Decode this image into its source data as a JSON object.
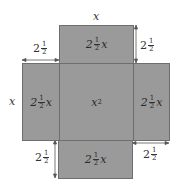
{
  "diagram": {
    "colors": {
      "face": "#9a9a9a",
      "edge": "#6e6e6e",
      "text": "#2a2a2a"
    },
    "faces": {
      "top": {
        "whole": "2",
        "num": "1",
        "den": "2",
        "var": "x"
      },
      "left": {
        "whole": "2",
        "num": "1",
        "den": "2",
        "var": "x"
      },
      "center": {
        "label": "x",
        "exp": "2"
      },
      "right": {
        "whole": "2",
        "num": "1",
        "den": "2",
        "var": "x"
      },
      "bottom": {
        "whole": "2",
        "num": "1",
        "den": "2",
        "var": "x"
      }
    },
    "dimensions": {
      "top_width": "x",
      "left_height": "x",
      "top_left": {
        "whole": "2",
        "num": "1",
        "den": "2"
      },
      "top_right": {
        "whole": "2",
        "num": "1",
        "den": "2"
      },
      "bottom_left": {
        "whole": "2",
        "num": "1",
        "den": "2"
      },
      "bottom_right": {
        "whole": "2",
        "num": "1",
        "den": "2"
      }
    }
  }
}
